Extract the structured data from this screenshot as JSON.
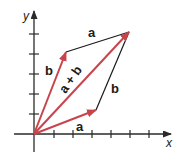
{
  "diagram": {
    "colors": {
      "vector": "#c8444c",
      "axis": "#2a2a2a",
      "edge": "#1a1a1a"
    },
    "axes": {
      "x_label": "x",
      "y_label": "y",
      "x_ticks": 6,
      "y_ticks": 5
    },
    "vectors": [
      {
        "name": "a",
        "label": "a",
        "from": [
          0,
          0
        ],
        "to": [
          3,
          1
        ]
      },
      {
        "name": "b",
        "label": "b",
        "from": [
          0,
          0
        ],
        "to": [
          1.6,
          4.1
        ]
      },
      {
        "name": "a+b",
        "label": "a + b",
        "from": [
          0,
          0
        ],
        "to": [
          4.9,
          5.1
        ]
      }
    ],
    "edges": [
      {
        "label": "a",
        "from": "b-tip",
        "to": "sum-tip"
      },
      {
        "label": "b",
        "from": "a-tip",
        "to": "sum-tip"
      }
    ],
    "labels": {
      "a_bottom": "a",
      "a_top": "a",
      "b_left": "b",
      "b_right": "b",
      "sum": "a + b"
    }
  }
}
